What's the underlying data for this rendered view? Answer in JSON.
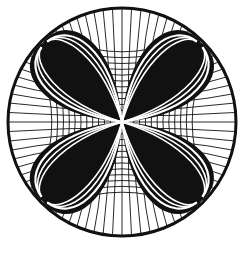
{
  "artwork": {
    "shape": "circle",
    "petals": 4,
    "colors": {
      "ink": "#111111",
      "background": "#ffffff"
    }
  }
}
